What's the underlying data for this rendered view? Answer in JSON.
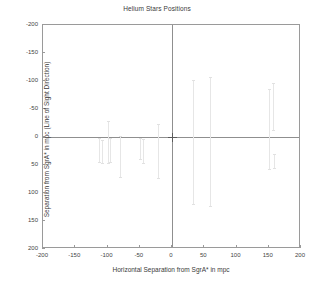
{
  "chart_data": {
    "type": "scatter",
    "title": "Helium Stars Positions",
    "xlabel": "Horizontal Separation from SgrA* in mpc",
    "ylabel": "Separation from SgrA* in mpc (Line of Sight Direction)",
    "xlim": [
      -200,
      200
    ],
    "ylim": [
      -200,
      200
    ],
    "y_inverted": true,
    "grid": false,
    "legend": null,
    "xticks": [
      -200,
      -150,
      -100,
      -50,
      0,
      50,
      100,
      150,
      200
    ],
    "yticks": [
      -200,
      -150,
      -100,
      -50,
      0,
      50,
      100,
      150,
      200
    ],
    "xticklabels": [
      "-200",
      "-150",
      "-100",
      "-50",
      "0",
      "50",
      "100",
      "150",
      "200"
    ],
    "yticklabels": [
      "-200",
      "-150",
      "-100",
      "-50",
      "0",
      "50",
      "100",
      "150",
      "200"
    ],
    "origin_marker": {
      "name": "SgrA*",
      "x": 0,
      "y": 0,
      "symbol": "x",
      "color": "#5a5a5a"
    },
    "series": [
      {
        "name": "Helium stars (line-of-sight uncertainty bars)",
        "color": "#e6e6e6",
        "points": [
          {
            "x": -113,
            "y": 22,
            "ylow": 2,
            "yhigh": 44
          },
          {
            "x": -108,
            "y": 26,
            "ylow": 6,
            "yhigh": 46
          },
          {
            "x": -99,
            "y": 3,
            "ylow": -28,
            "yhigh": 47
          },
          {
            "x": -96,
            "y": 22,
            "ylow": 1,
            "yhigh": 44
          },
          {
            "x": -81,
            "y": 34,
            "ylow": -2,
            "yhigh": 72
          },
          {
            "x": -50,
            "y": 20,
            "ylow": 1,
            "yhigh": 40
          },
          {
            "x": -45,
            "y": 26,
            "ylow": 4,
            "yhigh": 46
          },
          {
            "x": -21,
            "y": 26,
            "ylow": -24,
            "yhigh": 74
          },
          {
            "x": 33,
            "y": 7,
            "ylow": -102,
            "yhigh": 120
          },
          {
            "x": 59,
            "y": 10,
            "ylow": -108,
            "yhigh": 124
          },
          {
            "x": 151,
            "y": -14,
            "ylow": -86,
            "yhigh": 57
          },
          {
            "x": 157,
            "y": -55,
            "ylow": -97,
            "yhigh": -12
          },
          {
            "x": 158,
            "y": 44,
            "ylow": 30,
            "yhigh": 56
          }
        ]
      }
    ]
  }
}
